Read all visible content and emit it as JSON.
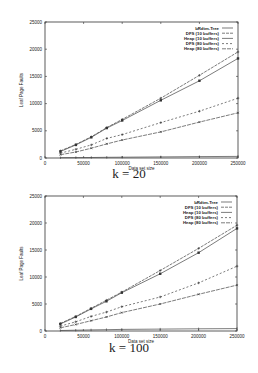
{
  "chart_data": [
    {
      "type": "line",
      "title": "",
      "caption": "k = 20",
      "xlabel": "Data set size",
      "ylabel": "Leaf Page Faults",
      "xlim": [
        0,
        250000
      ],
      "ylim": [
        0,
        25000
      ],
      "x_ticks": [
        0,
        50000,
        100000,
        150000,
        200000,
        250000
      ],
      "y_ticks": [
        0,
        5000,
        10000,
        15000,
        20000,
        25000
      ],
      "grid": false,
      "legend_position": "top-right",
      "x": [
        20000,
        40000,
        60000,
        80000,
        100000,
        150000,
        200000,
        250000
      ],
      "series": [
        {
          "name": "bRdtm-Tree",
          "values": [
            50,
            80,
            100,
            120,
            150,
            200,
            250,
            300
          ]
        },
        {
          "name": "DFS (10 buffers)",
          "values": [
            1300,
            2500,
            3900,
            5600,
            7100,
            11000,
            15200,
            19500
          ]
        },
        {
          "name": "Heap (10 buffers)",
          "values": [
            1200,
            2400,
            3800,
            5500,
            6900,
            10600,
            14200,
            18300
          ]
        },
        {
          "name": "DFS (80 buffers)",
          "values": [
            900,
            1600,
            2400,
            3600,
            4300,
            6500,
            8600,
            11000
          ]
        },
        {
          "name": "Heap (80 buffers)",
          "values": [
            600,
            1100,
            1800,
            2600,
            3300,
            4800,
            6600,
            8300
          ]
        }
      ]
    },
    {
      "type": "line",
      "title": "",
      "caption": "k = 100",
      "xlabel": "Data set size",
      "ylabel": "Leaf Page Faults",
      "xlim": [
        0,
        250000
      ],
      "ylim": [
        0,
        25000
      ],
      "x_ticks": [
        0,
        50000,
        100000,
        150000,
        200000,
        250000
      ],
      "y_ticks": [
        0,
        5000,
        10000,
        15000,
        20000,
        25000
      ],
      "grid": false,
      "legend_position": "top-right",
      "x": [
        20000,
        40000,
        60000,
        80000,
        100000,
        150000,
        200000,
        250000
      ],
      "series": [
        {
          "name": "bRdtm-Tree",
          "values": [
            100,
            150,
            200,
            250,
            300,
            350,
            400,
            450
          ]
        },
        {
          "name": "DFS (10 buffers)",
          "values": [
            1400,
            2700,
            4200,
            5700,
            7200,
            11200,
            15300,
            19600
          ]
        },
        {
          "name": "Heap (10 buffers)",
          "values": [
            1300,
            2600,
            4100,
            5500,
            7100,
            10600,
            14500,
            19000
          ]
        },
        {
          "name": "DFS (80 buffers)",
          "values": [
            900,
            1700,
            2700,
            3500,
            4500,
            6300,
            8900,
            12000
          ]
        },
        {
          "name": "Heap (80 buffers)",
          "values": [
            600,
            1200,
            1900,
            2600,
            3400,
            5000,
            6800,
            8500
          ]
        }
      ]
    }
  ]
}
